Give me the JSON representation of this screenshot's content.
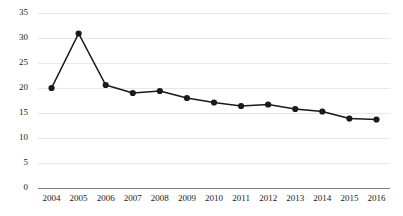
{
  "chart_data": {
    "type": "line",
    "title": "",
    "subtitle": "",
    "xlabel": "",
    "ylabel": "",
    "categories": [
      "2004",
      "2005",
      "2006",
      "2007",
      "2008",
      "2009",
      "2010",
      "2011",
      "2012",
      "2013",
      "2014",
      "2015",
      "2016"
    ],
    "x": [
      2004,
      2005,
      2006,
      2007,
      2008,
      2009,
      2010,
      2011,
      2012,
      2013,
      2014,
      2015,
      2016
    ],
    "values": [
      20.0,
      30.9,
      20.6,
      19.0,
      19.4,
      18.0,
      17.1,
      16.4,
      16.7,
      15.8,
      15.3,
      13.9,
      13.7
    ],
    "series": [
      {
        "name": "",
        "values": [
          20.0,
          30.9,
          20.6,
          19.0,
          19.4,
          18.0,
          17.1,
          16.4,
          16.7,
          15.8,
          15.3,
          13.9,
          13.7
        ]
      }
    ],
    "ylim": [
      0,
      35
    ],
    "yticks": [
      0,
      5,
      10,
      15,
      20,
      25,
      30,
      35
    ],
    "ytick_labels": [
      "0",
      "5",
      "10",
      "15",
      "20",
      "25",
      "30",
      "35"
    ],
    "xtick_labels": [
      "2004",
      "2005",
      "2006",
      "2007",
      "2008",
      "2009",
      "2010",
      "2011",
      "2012",
      "2013",
      "2014",
      "2015",
      "2016"
    ],
    "grid": true,
    "grid_axis": "y",
    "legend": false,
    "legend_position": "none",
    "marker": "circle",
    "line_color": "#1a1a1a",
    "marker_color": "#1a1a1a",
    "grid_color": "#e8e8e8",
    "axis_color": "#808080",
    "background_color": "#ffffff",
    "annotations": []
  }
}
